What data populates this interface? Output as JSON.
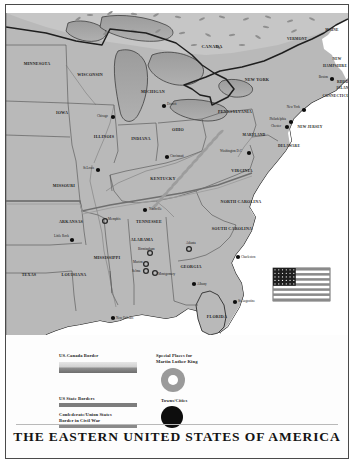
{
  "title": "THE EASTERN UNITED STATES OF AMERICA",
  "colors": {
    "land": "#b9b9b9",
    "land_light": "#cdcdcd",
    "water": "#ffffff",
    "lake": "#a0a0a0",
    "border": "#3a3a3a",
    "marker": "#0d0d0d",
    "ring": "#9a9a9a",
    "frame": "#4a4a4a"
  },
  "legend": {
    "items": [
      {
        "id": "us-canada-border",
        "label": "US-Canada Border",
        "swatch": "gradient"
      },
      {
        "id": "us-state-borders",
        "label": "US State Borders",
        "swatch": "solid"
      },
      {
        "id": "confederate-union-border",
        "label": "Confederate/Union States Border in Civil War",
        "label_line1": "Confederate/Union States",
        "label_line2": "Border in Civil War",
        "swatch": "double"
      },
      {
        "id": "mlk-places",
        "label": "Special Places for Martin Luther King",
        "label_line1": "Special Places for",
        "label_line2": "Martin Luther King",
        "swatch": "ring"
      },
      {
        "id": "towns-cities",
        "label": "Towns/Cities",
        "swatch": "dot"
      }
    ]
  },
  "map": {
    "country_labels": [
      {
        "name": "CANADA",
        "x": 206,
        "y": 43,
        "size": "s8"
      }
    ],
    "states": [
      {
        "name": "MINNESOTA",
        "x": 31,
        "y": 60,
        "size": "s7"
      },
      {
        "name": "WISCONSIN",
        "x": 84,
        "y": 71,
        "size": "s7"
      },
      {
        "name": "IOWA",
        "x": 56,
        "y": 109,
        "size": "s7"
      },
      {
        "name": "MICHIGAN",
        "x": 147,
        "y": 88,
        "size": "s7"
      },
      {
        "name": "ILLINOIS",
        "x": 98,
        "y": 133,
        "size": "s7"
      },
      {
        "name": "INDIANA",
        "x": 135,
        "y": 135,
        "size": "s7"
      },
      {
        "name": "OHIO",
        "x": 172,
        "y": 126,
        "size": "s7"
      },
      {
        "name": "MISSOURI",
        "x": 58,
        "y": 182,
        "size": "s7"
      },
      {
        "name": "KENTUCKY",
        "x": 157,
        "y": 175,
        "size": "s7"
      },
      {
        "name": "PENNSYLVANIA",
        "x": 229,
        "y": 108,
        "size": "s7"
      },
      {
        "name": "NEW YORK",
        "x": 251,
        "y": 76,
        "size": "s7"
      },
      {
        "name": "VERMONT",
        "x": 291,
        "y": 35,
        "size": "s6"
      },
      {
        "name": "MAINE",
        "x": 326,
        "y": 26,
        "size": "s6"
      },
      {
        "name": "NEW",
        "x": 331,
        "y": 55,
        "size": "s6"
      },
      {
        "name": "HAMPSHIRE",
        "x": 329,
        "y": 62,
        "size": "s6"
      },
      {
        "name": "RHODE",
        "x": 338,
        "y": 78,
        "size": "s6"
      },
      {
        "name": "ISLAND",
        "x": 338,
        "y": 84,
        "size": "s6"
      },
      {
        "name": "CONNECTICUT",
        "x": 331,
        "y": 92,
        "size": "s6"
      },
      {
        "name": "NEW JERSEY",
        "x": 304,
        "y": 123,
        "size": "s6"
      },
      {
        "name": "MARYLAND",
        "x": 248,
        "y": 131,
        "size": "s6"
      },
      {
        "name": "DELAWARE",
        "x": 283,
        "y": 142,
        "size": "s6"
      },
      {
        "name": "VIRGINIA",
        "x": 236,
        "y": 167,
        "size": "s7"
      },
      {
        "name": "NORTH CAROLINA",
        "x": 235,
        "y": 198,
        "size": "s7"
      },
      {
        "name": "SOUTH CAROLINA",
        "x": 226,
        "y": 225,
        "size": "s7"
      },
      {
        "name": "TENNESSEE",
        "x": 143,
        "y": 218,
        "size": "s7"
      },
      {
        "name": "ARKANSAS",
        "x": 65,
        "y": 218,
        "size": "s7"
      },
      {
        "name": "MISSISSIPPI",
        "x": 101,
        "y": 254,
        "size": "s7"
      },
      {
        "name": "ALABAMA",
        "x": 136,
        "y": 236,
        "size": "s7"
      },
      {
        "name": "GEORGIA",
        "x": 185,
        "y": 263,
        "size": "s7"
      },
      {
        "name": "LOUISIANA",
        "x": 68,
        "y": 271,
        "size": "s7"
      },
      {
        "name": "TEXAS",
        "x": 23,
        "y": 271,
        "size": "s7"
      },
      {
        "name": "FLORIDA",
        "x": 211,
        "y": 313,
        "size": "s7"
      }
    ],
    "cities": [
      {
        "name": "Chicago",
        "x": 102,
        "y": 112,
        "mx": 107,
        "my": 112,
        "type": "dot",
        "anchor": "r"
      },
      {
        "name": "Detroit",
        "x": 161,
        "y": 100,
        "mx": 158,
        "my": 101,
        "type": "dot",
        "anchor": "l"
      },
      {
        "name": "Cincinnati",
        "x": 164,
        "y": 152,
        "mx": 161,
        "my": 152,
        "type": "dot",
        "anchor": "l"
      },
      {
        "name": "St.Louis",
        "x": 88,
        "y": 164,
        "mx": 92,
        "my": 165,
        "type": "dot",
        "anchor": "r"
      },
      {
        "name": "New York",
        "x": 294,
        "y": 103,
        "mx": 298,
        "my": 105,
        "type": "dot",
        "anchor": "r"
      },
      {
        "name": "Philadelphia",
        "x": 280,
        "y": 115,
        "mx": 285,
        "my": 117,
        "type": "dot",
        "anchor": "r"
      },
      {
        "name": "Chester",
        "x": 275,
        "y": 122,
        "mx": 281,
        "my": 122,
        "type": "dot",
        "anchor": "r"
      },
      {
        "name": "Boston",
        "x": 322,
        "y": 73,
        "mx": 326,
        "my": 74,
        "type": "dot",
        "anchor": "r"
      },
      {
        "name": "Washington D.C",
        "x": 236,
        "y": 147,
        "mx": 243,
        "my": 148,
        "type": "dot",
        "anchor": "r"
      },
      {
        "name": "Little Rock",
        "x": 48,
        "y": 232,
        "mx": 66,
        "my": 235,
        "type": "dot",
        "anchor": "l"
      },
      {
        "name": "Memphis",
        "x": 102,
        "y": 215,
        "mx": 99,
        "my": 216,
        "type": "ring",
        "anchor": "l"
      },
      {
        "name": "Nashville",
        "x": 143,
        "y": 205,
        "mx": 139,
        "my": 205,
        "type": "dot",
        "anchor": "l"
      },
      {
        "name": "Birmingham",
        "x": 132,
        "y": 245,
        "mx": 144,
        "my": 248,
        "type": "ring",
        "anchor": "l"
      },
      {
        "name": "Marion",
        "x": 127,
        "y": 258,
        "mx": 140,
        "my": 259,
        "type": "ring",
        "anchor": "l"
      },
      {
        "name": "Selma",
        "x": 126,
        "y": 267,
        "mx": 140,
        "my": 266,
        "type": "ring",
        "anchor": "l"
      },
      {
        "name": "Montgomery",
        "x": 152,
        "y": 270,
        "mx": 149,
        "my": 268,
        "type": "ring",
        "anchor": "l"
      },
      {
        "name": "Atlanta",
        "x": 180,
        "y": 239,
        "mx": 183,
        "my": 244,
        "type": "ring",
        "anchor": "l"
      },
      {
        "name": "Albany",
        "x": 191,
        "y": 280,
        "mx": 188,
        "my": 279,
        "type": "dot",
        "anchor": "l"
      },
      {
        "name": "Charleston",
        "x": 235,
        "y": 253,
        "mx": 232,
        "my": 252,
        "type": "dot",
        "anchor": "l"
      },
      {
        "name": "St Augustine",
        "x": 232,
        "y": 297,
        "mx": 229,
        "my": 297,
        "type": "dot",
        "anchor": "l"
      },
      {
        "name": "New Orleans",
        "x": 110,
        "y": 314,
        "mx": 107,
        "my": 313,
        "type": "dot",
        "anchor": "l"
      }
    ],
    "flag": {
      "name": "us-flag",
      "stripes": 13,
      "x": 267,
      "y": 263,
      "w": 57,
      "h": 33
    }
  }
}
